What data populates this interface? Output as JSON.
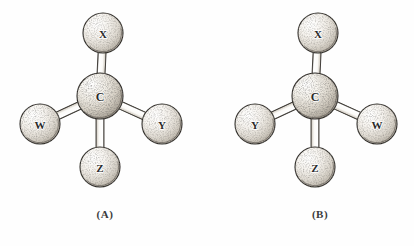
{
  "figure": {
    "background_color": "#fefefe",
    "ink_color": "#2b2b2b",
    "sphere_fill": "#f2efe9",
    "sphere_shade": "#8e8madd",
    "bond_fill": "#fbfaf7"
  },
  "panels": [
    {
      "id": "panel-a",
      "caption": "(A)",
      "center": {
        "label": "C",
        "cx": 100,
        "cy": 96,
        "r": 23
      },
      "substituents": [
        {
          "position": "top",
          "label": "X",
          "cx": 103,
          "cy": 33,
          "r": 20
        },
        {
          "position": "left",
          "label": "W",
          "cx": 40,
          "cy": 124,
          "r": 20
        },
        {
          "position": "right",
          "label": "Y",
          "cx": 162,
          "cy": 124,
          "r": 20
        },
        {
          "position": "bottom",
          "label": "Z",
          "cx": 100,
          "cy": 167,
          "r": 20
        }
      ]
    },
    {
      "id": "panel-b",
      "caption": "(B)",
      "center": {
        "label": "C",
        "cx": 315,
        "cy": 96,
        "r": 23
      },
      "substituents": [
        {
          "position": "top",
          "label": "X",
          "cx": 318,
          "cy": 33,
          "r": 20
        },
        {
          "position": "left",
          "label": "Y",
          "cx": 255,
          "cy": 124,
          "r": 20
        },
        {
          "position": "right",
          "label": "W",
          "cx": 377,
          "cy": 124,
          "r": 20
        },
        {
          "position": "bottom",
          "label": "Z",
          "cx": 315,
          "cy": 167,
          "r": 20
        }
      ]
    }
  ]
}
